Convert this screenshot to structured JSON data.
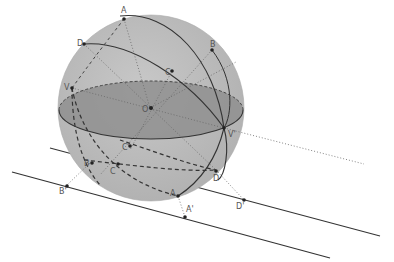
{
  "diagram": {
    "type": "sphere-projection",
    "colors": {
      "sphere_fill": "#bdbdbd",
      "equator_fill": "#8c8c8c",
      "line": "#333333",
      "dotted": "#777777",
      "label": "#555555",
      "background": "#ffffff"
    },
    "labels": {
      "A": "A",
      "B": "B",
      "C": "C",
      "D": "D",
      "O": "O",
      "V": "V",
      "V_prime": "V'",
      "A_low": "A",
      "B_low": "B",
      "C_low": "C",
      "D_low": "D",
      "C_prime": "C'",
      "A_prime": "A'",
      "B_prime": "B'",
      "D_prime": "D'"
    }
  }
}
